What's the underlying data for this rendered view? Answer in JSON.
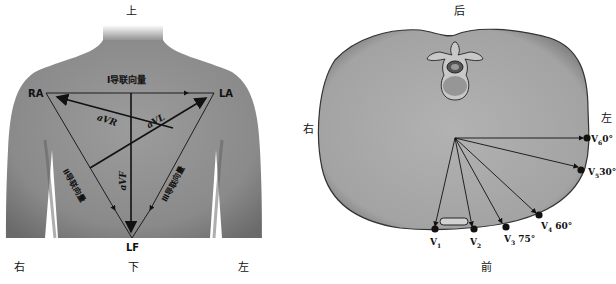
{
  "left_panel": {
    "title": "Einthoven triangle limb leads",
    "directions": {
      "top": "上",
      "bottom": "下",
      "left": "右",
      "right": "左"
    },
    "electrodes": {
      "ra": "RA",
      "la": "LA",
      "lf": "LF"
    },
    "leads": {
      "lead_I": "Ⅰ导联向量",
      "lead_II": "Ⅱ导联向量",
      "lead_III": "Ⅲ导联向量",
      "avr": "aVR",
      "avl": "aVL",
      "avf": "aVF"
    }
  },
  "right_panel": {
    "title": "Chest leads cross-section",
    "directions": {
      "top": "后",
      "bottom": "前",
      "left": "右",
      "right": "左"
    },
    "chest_leads": [
      {
        "name": "V",
        "sub": "1",
        "angle": ""
      },
      {
        "name": "V",
        "sub": "2",
        "angle": ""
      },
      {
        "name": "V",
        "sub": "3",
        "angle": "75°"
      },
      {
        "name": "V",
        "sub": "4",
        "angle": "60°"
      },
      {
        "name": "V",
        "sub": "5",
        "angle": "30°"
      },
      {
        "name": "V",
        "sub": "6",
        "angle": "0°"
      }
    ]
  },
  "colors": {
    "body_gray": "#8a8a8a",
    "section_gray": "#a9a9a9",
    "line": "#111111"
  }
}
